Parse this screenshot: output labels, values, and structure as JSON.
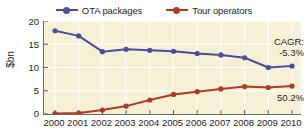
{
  "chart_data": {
    "type": "line",
    "title": "",
    "subtitle": "",
    "xlabel": "",
    "ylabel": "$bn",
    "categories": [
      "2000",
      "2001",
      "2002",
      "2003",
      "2004",
      "2005",
      "2006",
      "2007",
      "2008",
      "2009",
      "2010"
    ],
    "x": [
      2000,
      2001,
      2002,
      2003,
      2004,
      2005,
      2006,
      2007,
      2008,
      2009,
      2010
    ],
    "ylim": [
      0,
      20
    ],
    "yticks": [
      0,
      5,
      10,
      15,
      20
    ],
    "ytick_labels": [
      "0",
      "5",
      "10",
      "15",
      "20"
    ],
    "grid": true,
    "legend_position": "top-center",
    "series": [
      {
        "name": "OTA packages",
        "color": "#4a4e9c",
        "values": [
          17.9,
          16.8,
          13.4,
          13.9,
          13.7,
          13.5,
          13.0,
          12.7,
          12.1,
          10.0,
          10.3
        ]
      },
      {
        "name": "Tour operators",
        "color": "#b03a22",
        "values": [
          0.1,
          0.2,
          0.85,
          1.7,
          3.0,
          4.2,
          4.8,
          5.4,
          5.9,
          5.7,
          6.0
        ]
      }
    ],
    "annotations": {
      "cagr_title": "CAGR:",
      "cagr_ota": "-5.3%",
      "cagr_tour": "50.2%"
    },
    "colors": {
      "plot_background": "#f6f1d6",
      "axis": "#6b6b5a",
      "grid": "#ffffff",
      "text": "#231f20",
      "ota_packages": "#4a4e9c",
      "tour_operators": "#b03a22"
    }
  },
  "legend": {
    "items": [
      {
        "label": "OTA packages",
        "color": "#4a4e9c"
      },
      {
        "label": "Tour operators",
        "color": "#b03a22"
      }
    ]
  },
  "axes": {
    "y_title": "$bn",
    "y_tick_labels": [
      "20",
      "15",
      "10",
      "5",
      "0"
    ],
    "x_tick_labels": [
      "2000",
      "2001",
      "2002",
      "2003",
      "2004",
      "2005",
      "2006",
      "2007",
      "2008",
      "2009",
      "2010"
    ]
  },
  "annotations": {
    "cagr_title": "CAGR:",
    "cagr_ota": "-5.3%",
    "cagr_tour": "50.2%"
  }
}
